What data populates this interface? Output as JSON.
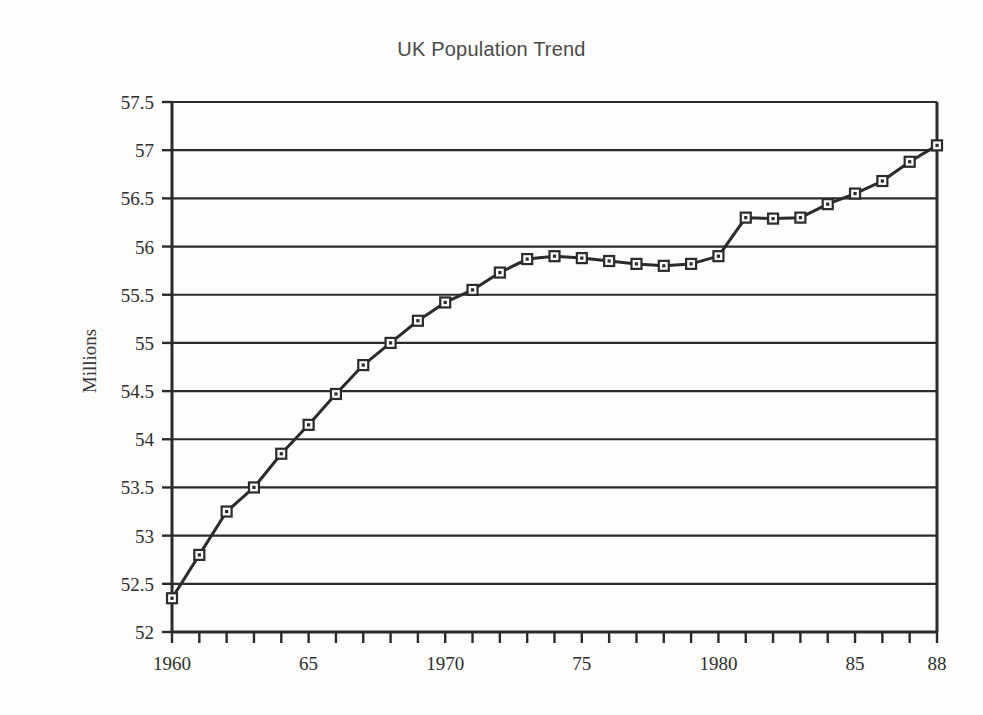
{
  "chart_data": {
    "type": "line",
    "title": "UK Population Trend",
    "xlabel": "",
    "ylabel": "Millions",
    "xlim": [
      1960,
      1988
    ],
    "ylim": [
      52,
      57.5
    ],
    "grid": "horizontal",
    "legend": "none",
    "y_ticks": [
      52,
      52.5,
      53,
      53.5,
      54,
      54.5,
      55,
      55.5,
      56,
      56.5,
      57,
      57.5
    ],
    "y_tick_labels": [
      "52",
      "52.5",
      "53",
      "53.5",
      "54",
      "54.5",
      "55",
      "55.5",
      "56",
      "56.5",
      "57",
      "57.5"
    ],
    "x_ticks": [
      1960,
      1961,
      1962,
      1963,
      1964,
      1965,
      1966,
      1967,
      1968,
      1969,
      1970,
      1971,
      1972,
      1973,
      1974,
      1975,
      1976,
      1977,
      1978,
      1979,
      1980,
      1981,
      1982,
      1983,
      1984,
      1985,
      1986,
      1987,
      1988
    ],
    "x_labeled_ticks": [
      {
        "value": 1960,
        "label": "1960"
      },
      {
        "value": 1965,
        "label": "65"
      },
      {
        "value": 1970,
        "label": "1970"
      },
      {
        "value": 1975,
        "label": "75"
      },
      {
        "value": 1980,
        "label": "1980"
      },
      {
        "value": 1985,
        "label": "85"
      },
      {
        "value": 1988,
        "label": "88"
      }
    ],
    "marker": "square-open",
    "line_color": "#2b2b2b",
    "x": [
      1960,
      1961,
      1962,
      1963,
      1964,
      1965,
      1966,
      1967,
      1968,
      1969,
      1970,
      1971,
      1972,
      1973,
      1974,
      1975,
      1976,
      1977,
      1978,
      1979,
      1980,
      1981,
      1982,
      1983,
      1984,
      1985,
      1986,
      1987,
      1988
    ],
    "values": [
      52.35,
      52.8,
      53.25,
      53.5,
      53.85,
      54.15,
      54.47,
      54.77,
      55.0,
      55.23,
      55.42,
      55.55,
      55.73,
      55.87,
      55.9,
      55.88,
      55.85,
      55.82,
      55.8,
      55.82,
      55.9,
      56.3,
      56.29,
      56.3,
      56.44,
      56.55,
      56.68,
      56.88,
      57.05
    ]
  },
  "accent": {
    "title_color": "#4a4a4a",
    "axis_color": "#2b2b2b",
    "grid_color": "#2b2b2b",
    "background": "#fdfdfc"
  }
}
